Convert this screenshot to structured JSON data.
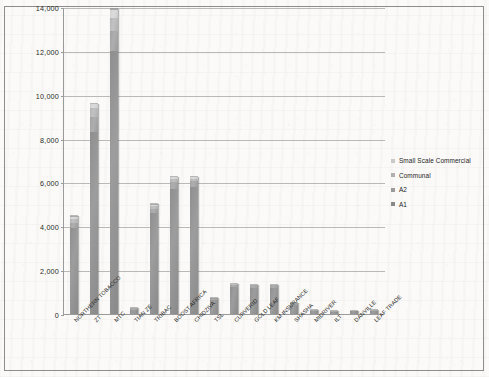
{
  "chart_data": {
    "type": "bar",
    "stacked": true,
    "title": "",
    "subtitle": "",
    "xlabel": "",
    "ylabel": "",
    "ylim": [
      0,
      14000
    ],
    "yticks": [
      "0",
      "2,000",
      "4,000",
      "6,000",
      "8,000",
      "10,000",
      "12,000",
      "14,000"
    ],
    "ytick_values": [
      0,
      2000,
      4000,
      6000,
      8000,
      10000,
      12000,
      14000
    ],
    "grid": true,
    "legend_position": "right",
    "categories": [
      "NORTHERN TOBACCO",
      "ZT",
      "MTC",
      "TIAN ZE",
      "TRIBAC",
      "BOOST AFRICA",
      "CHIDZIVA",
      "TSL",
      "CURVERID",
      "GOLD LEAF",
      "KM INSURANCE",
      "SHASHA",
      "MIDRIVER",
      "ILT",
      "DANVILLE",
      "LEAF TRADE"
    ],
    "series": [
      {
        "name": "A1",
        "values": [
          3900,
          8300,
          12000,
          200,
          4600,
          5700,
          5800,
          650,
          1250,
          1200,
          1200,
          420,
          160,
          90,
          120,
          130
        ]
      },
      {
        "name": "A2",
        "values": [
          250,
          700,
          900,
          30,
          200,
          300,
          250,
          40,
          70,
          60,
          60,
          40,
          25,
          15,
          20,
          20
        ]
      },
      {
        "name": "Communal",
        "values": [
          180,
          400,
          600,
          15,
          120,
          150,
          120,
          20,
          30,
          30,
          30,
          20,
          10,
          8,
          10,
          10
        ]
      },
      {
        "name": "Small Scale Commercial",
        "values": [
          120,
          200,
          400,
          10,
          80,
          100,
          80,
          15,
          20,
          20,
          20,
          15,
          8,
          5,
          8,
          8
        ]
      }
    ],
    "totals": [
      4450,
      9600,
      13900,
      255,
      5000,
      6250,
      6250,
      725,
      1370,
      1310,
      1310,
      495,
      203,
      118,
      158,
      168
    ]
  },
  "legend": {
    "items": [
      {
        "label": "Small Scale Commercial",
        "key": "ssc"
      },
      {
        "label": "Communal",
        "key": "communal"
      },
      {
        "label": "A2",
        "key": "a2"
      },
      {
        "label": "A1",
        "key": "a1"
      }
    ]
  }
}
